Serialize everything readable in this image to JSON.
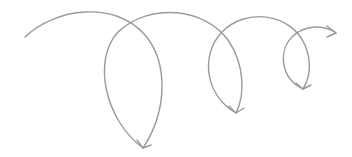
{
  "graphic": {
    "description": "Decorative looping spiral arrow",
    "stroke_color": "#9a9a9a",
    "stroke_width": 1.4,
    "background": "#ffffff",
    "loop_count": 4
  }
}
